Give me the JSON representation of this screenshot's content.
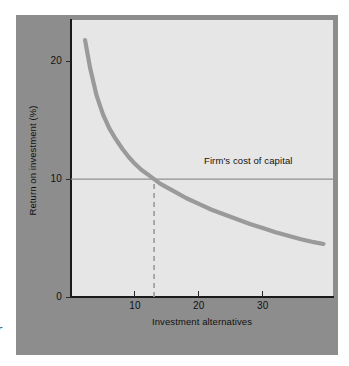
{
  "figure": {
    "panel_bg_color": "#8d8d8d",
    "plot_bg_color": "#e6e6e6",
    "axis_color": "#1a1a1a",
    "curve_color": "#9a9a9a",
    "hline_color": "#8f8f8f",
    "dashed_color": "#9a9a9a",
    "caption_fragment": "r"
  },
  "chart_data": {
    "type": "line",
    "title": "",
    "subtitle": "",
    "xlabel": "Investment alternatives",
    "ylabel": "Return on investment (%)",
    "xlim": [
      0,
      41
    ],
    "ylim": [
      0,
      23.5
    ],
    "xticks": [
      10,
      20,
      30
    ],
    "xticklabels": [
      "10",
      "20",
      "30"
    ],
    "yticks": [
      0,
      10,
      20
    ],
    "yticklabels": [
      "0",
      "10",
      "20"
    ],
    "grid": false,
    "legend": "none",
    "series": [
      {
        "name": "Return on investment schedule",
        "style": "thick-solid-gray",
        "x": [
          2.2,
          3,
          4,
          5,
          6,
          7,
          8,
          9,
          10,
          11,
          12,
          13,
          14,
          16,
          18,
          20,
          22,
          24,
          26,
          28,
          30,
          32,
          34,
          36,
          38,
          39.5
        ],
        "y": [
          21.8,
          19.4,
          17.1,
          15.5,
          14.3,
          13.4,
          12.6,
          11.9,
          11.3,
          10.8,
          10.4,
          10.0,
          9.6,
          9.0,
          8.4,
          7.9,
          7.4,
          7.0,
          6.6,
          6.2,
          5.85,
          5.5,
          5.2,
          4.9,
          4.65,
          4.5
        ]
      }
    ],
    "annotations": [
      {
        "name": "cost-of-capital-line",
        "type": "hline",
        "y": 10,
        "label": "Firm's cost of capital",
        "label_x": 22,
        "label_position": "above-right"
      },
      {
        "name": "optimal-budget-dropline",
        "type": "vline-dashed",
        "x": 13,
        "y_from": 0,
        "y_to": 10,
        "label": ""
      }
    ]
  }
}
